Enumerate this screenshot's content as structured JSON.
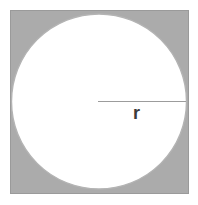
{
  "figure": {
    "kind": "geometry-diagram",
    "background_color": "#ffffff",
    "square": {
      "label": "square",
      "fill_color": "#ababab",
      "stroke_color": "#9a9a9a",
      "x": 10,
      "y": 10,
      "width": 179,
      "height": 184
    },
    "circle": {
      "label": "circle",
      "fill_color": "#ffffff",
      "stroke_color": "#b4b4b4",
      "cx": 99,
      "cy": 101,
      "r": 88
    },
    "radius_segment": {
      "label": "radius",
      "stroke_color": "#9c9c9c",
      "x1": 98,
      "y1": 101,
      "x2": 186,
      "y2": 101
    },
    "radius_label": {
      "text": "r",
      "color": "#3b3b3b",
      "x": 136,
      "y": 108
    }
  }
}
